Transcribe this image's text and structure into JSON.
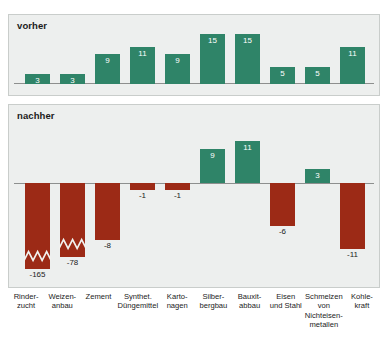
{
  "panels": {
    "vorher": {
      "title": "vorher"
    },
    "nachher": {
      "title": "nachher"
    }
  },
  "colors": {
    "positive": "#2f8468",
    "negative": "#9c2a16",
    "panel_background": "#edefee",
    "panel_border": "#c9cdcb",
    "axis": "#8d8f8e",
    "text": "#1b1b1b"
  },
  "categories": [
    {
      "lines": [
        "Rinder-",
        "zucht"
      ]
    },
    {
      "lines": [
        "Weizen-",
        "anbau"
      ]
    },
    {
      "lines": [
        "Zement"
      ]
    },
    {
      "lines": [
        "Synthet.",
        "Düngemittel"
      ]
    },
    {
      "lines": [
        "Karto-",
        "nagen"
      ]
    },
    {
      "lines": [
        "Silber-",
        "bergbau"
      ]
    },
    {
      "lines": [
        "Bauxit-",
        "abbau"
      ]
    },
    {
      "lines": [
        "Eisen",
        "und Stahl"
      ]
    },
    {
      "lines": [
        "Schmelzen",
        "von",
        "Nichteisen-",
        "metallen"
      ]
    },
    {
      "lines": [
        "Kohle-",
        "kraft"
      ]
    }
  ],
  "chart_data": {
    "type": "bar",
    "title": "",
    "xlabel": "",
    "ylabel": "",
    "grid": false,
    "legend": "none",
    "categories": [
      "Rinderzucht",
      "Weizenanbau",
      "Zement",
      "Synthet. Düngemittel",
      "Kartonagen",
      "Silberbergbau",
      "Bauxitabbau",
      "Eisen und Stahl",
      "Schmelzen von Nichteisenmetallen",
      "Kohlekraft"
    ],
    "series": [
      {
        "name": "vorher",
        "values": [
          3,
          3,
          9,
          11,
          9,
          15,
          15,
          5,
          5,
          11
        ],
        "labels": [
          "3",
          "3",
          "9",
          "11",
          "9",
          "15",
          "15",
          "5",
          "5",
          "11"
        ],
        "ylim": [
          0,
          16
        ]
      },
      {
        "name": "nachher",
        "values": [
          -165,
          -78,
          -8,
          -1,
          -1,
          9,
          11,
          -6,
          3,
          -11
        ],
        "labels": [
          "-165",
          "-78",
          "-8",
          "-1",
          "-1",
          "9",
          "11",
          "-6",
          "3",
          "-11"
        ],
        "truncated": [
          true,
          true,
          false,
          false,
          false,
          false,
          false,
          false,
          false,
          false
        ],
        "ylim": [
          -20,
          12
        ]
      }
    ]
  },
  "bars_vorher": [
    {
      "value": 3,
      "label": "3",
      "height_px": 10
    },
    {
      "value": 3,
      "label": "3",
      "height_px": 10
    },
    {
      "value": 9,
      "label": "9",
      "height_px": 30
    },
    {
      "value": 11,
      "label": "11",
      "height_px": 37
    },
    {
      "value": 9,
      "label": "9",
      "height_px": 30
    },
    {
      "value": 15,
      "label": "15",
      "height_px": 50
    },
    {
      "value": 15,
      "label": "15",
      "height_px": 50
    },
    {
      "value": 5,
      "label": "5",
      "height_px": 17
    },
    {
      "value": 5,
      "label": "5",
      "height_px": 17
    },
    {
      "value": 11,
      "label": "11",
      "height_px": 37
    }
  ],
  "bars_nachher": [
    {
      "value": -165,
      "label": "-165",
      "dir": "neg",
      "height_px": 86,
      "truncated": true,
      "label_pos": "outside"
    },
    {
      "value": -78,
      "label": "-78",
      "dir": "neg",
      "height_px": 74,
      "truncated": true,
      "label_pos": "outside"
    },
    {
      "value": -8,
      "label": "-8",
      "dir": "neg",
      "height_px": 57,
      "truncated": false,
      "label_pos": "outside"
    },
    {
      "value": -1,
      "label": "-1",
      "dir": "neg",
      "height_px": 7,
      "truncated": false,
      "label_pos": "outside"
    },
    {
      "value": -1,
      "label": "-1",
      "dir": "neg",
      "height_px": 7,
      "truncated": false,
      "label_pos": "outside"
    },
    {
      "value": 9,
      "label": "9",
      "dir": "pos",
      "height_px": 34,
      "truncated": false,
      "label_pos": "inside"
    },
    {
      "value": 11,
      "label": "11",
      "dir": "pos",
      "height_px": 42,
      "truncated": false,
      "label_pos": "inside"
    },
    {
      "value": -6,
      "label": "-6",
      "dir": "neg",
      "height_px": 43,
      "truncated": false,
      "label_pos": "outside"
    },
    {
      "value": 3,
      "label": "3",
      "dir": "pos",
      "height_px": 14,
      "truncated": false,
      "label_pos": "inside"
    },
    {
      "value": -11,
      "label": "-11",
      "dir": "neg",
      "height_px": 66,
      "truncated": false,
      "label_pos": "outside"
    }
  ]
}
